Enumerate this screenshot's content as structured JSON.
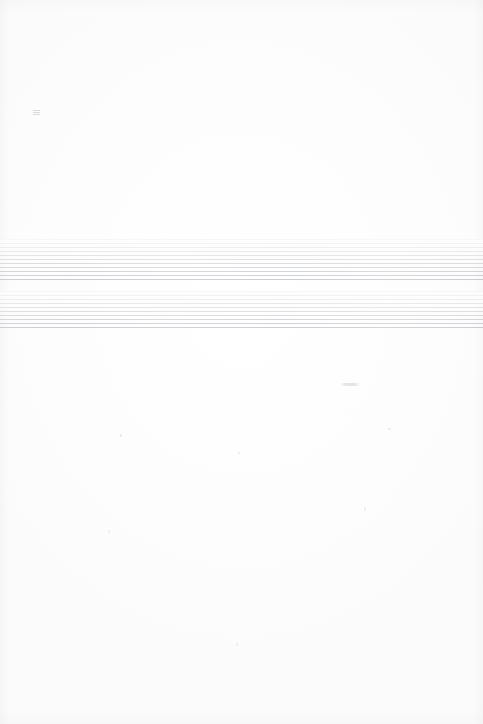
{
  "document": {
    "kind": "scanned-page",
    "title": "",
    "visible_text": "",
    "page_width": 483,
    "page_height": 724,
    "paper_color": "#fdfdfd",
    "content_note": "blank scanned page with two faint striped bands"
  },
  "bands": [
    {
      "id": "band-1",
      "label": "",
      "top": 239,
      "height": 42,
      "left": 0,
      "width": 483,
      "stripe_period_px": 4,
      "stripe_color": "#787e86",
      "gradient": "darkens toward bottom"
    },
    {
      "id": "band-2",
      "label": "",
      "top": 291,
      "height": 39,
      "left": 0,
      "width": 483,
      "stripe_period_px": 4,
      "stripe_color": "#787e86",
      "gradient": "darkens toward bottom"
    }
  ],
  "marks": [
    {
      "id": "smudge-top",
      "label": "",
      "x": 33,
      "y": 110
    },
    {
      "id": "smudge-mid",
      "label": "",
      "x": 340,
      "y": 383
    }
  ]
}
